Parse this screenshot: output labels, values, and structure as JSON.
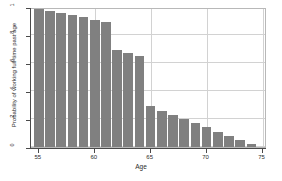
{
  "chart_data": {
    "type": "bar",
    "title": "",
    "xlabel": "Age",
    "ylabel": "Probability of working full-time past age",
    "categories": [
      55,
      56,
      57,
      58,
      59,
      60,
      61,
      62,
      63,
      64,
      65,
      66,
      67,
      68,
      69,
      70,
      71,
      72,
      73,
      74
    ],
    "values": [
      0.99,
      0.97,
      0.96,
      0.94,
      0.93,
      0.91,
      0.89,
      0.69,
      0.67,
      0.65,
      0.29,
      0.26,
      0.23,
      0.2,
      0.17,
      0.14,
      0.11,
      0.08,
      0.05,
      0.02
    ],
    "xlim": [
      54.3,
      75.4
    ],
    "ylim": [
      0,
      1.0
    ],
    "grid": true,
    "legend": null,
    "bar_color": "#808080",
    "x_ticks": [
      {
        "value": 55,
        "label": "55"
      },
      {
        "value": 60,
        "label": "60"
      },
      {
        "value": 65,
        "label": "65"
      },
      {
        "value": 70,
        "label": "70"
      },
      {
        "value": 75,
        "label": "75"
      }
    ],
    "y_ticks": [
      {
        "value": 0,
        "label": "0"
      },
      {
        "value": 0.2,
        "label": ".2"
      },
      {
        "value": 0.4,
        "label": ".4"
      },
      {
        "value": 0.6,
        "label": ".6"
      },
      {
        "value": 0.8,
        "label": ".8"
      },
      {
        "value": 1.0,
        "label": "1"
      }
    ]
  }
}
